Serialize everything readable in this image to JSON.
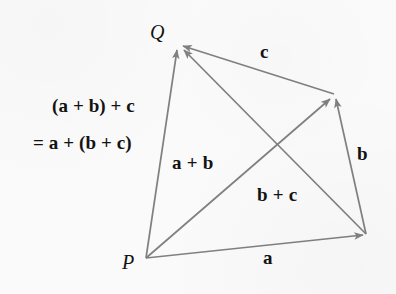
{
  "figure": {
    "background_color": "#fbfafa",
    "stroke_color": "#808083",
    "text_color": "#131313"
  },
  "points": {
    "p": {
      "label": "P",
      "x": 146,
      "y": 258
    },
    "q": {
      "label": "Q",
      "x": 178,
      "y": 44
    },
    "r": {
      "x": 334,
      "y": 94
    },
    "s": {
      "x": 366,
      "y": 234
    }
  },
  "vectors": [
    {
      "name": "a",
      "label": "a",
      "from": "p",
      "to": "s",
      "label_x": 268,
      "label_y": 258
    },
    {
      "name": "b",
      "label": "b",
      "from": "s",
      "to": "r",
      "label_x": 363,
      "label_y": 154
    },
    {
      "name": "c",
      "label": "c",
      "from": "r",
      "to": "q",
      "label_x": 265,
      "label_y": 52
    },
    {
      "name": "a-plus-b",
      "label": "a + b",
      "from": "p",
      "to": "r",
      "label_x": 205,
      "label_y": 163
    },
    {
      "name": "b-plus-c",
      "label": "b + c",
      "from": "s",
      "to": "q",
      "label_x": 290,
      "label_y": 195
    },
    {
      "name": "sum-total",
      "label": "",
      "from": "p",
      "to": "q",
      "label_x": 0,
      "label_y": 0
    }
  ],
  "annotations": {
    "sum_line_1": "(a + b) + c",
    "sum_line_2": "= a + (b + c)"
  }
}
